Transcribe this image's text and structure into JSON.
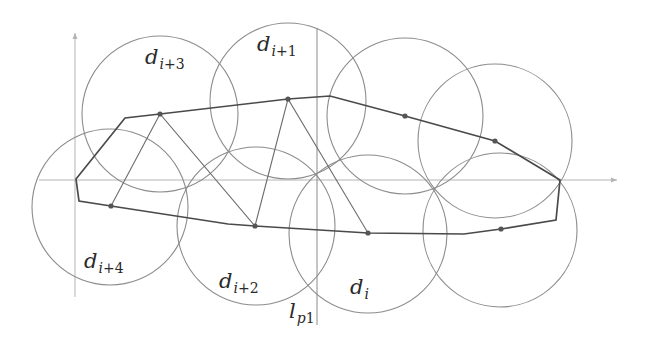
{
  "figure": {
    "colors": {
      "background": "#ffffff",
      "axis": "#b4b4b4",
      "disk_stroke": "#8c8c8c",
      "hull_stroke": "#4a4a4a",
      "zigzag_stroke": "#6e6e6e",
      "dot_fill": "#555555"
    },
    "axes": {
      "vertical": {
        "x": 75,
        "y1": 297,
        "y2": 33
      },
      "horizontal": {
        "y": 180,
        "x1": 39,
        "x2": 617
      }
    },
    "line_lp1": {
      "x": 317,
      "y1": 28,
      "y2": 325
    },
    "disks": [
      {
        "id": "d_i+3",
        "cx": 160,
        "cy": 114,
        "r": 78
      },
      {
        "id": "d_i+1",
        "cx": 288,
        "cy": 101,
        "r": 78
      },
      {
        "id": "disk-top-3",
        "cx": 405,
        "cy": 116,
        "r": 78
      },
      {
        "id": "disk-top-4",
        "cx": 495,
        "cy": 141,
        "r": 77
      },
      {
        "id": "d_i+4",
        "cx": 110,
        "cy": 207,
        "r": 78
      },
      {
        "id": "d_i+2",
        "cx": 256,
        "cy": 226,
        "r": 79
      },
      {
        "id": "d_i",
        "cx": 368,
        "cy": 234,
        "r": 79
      },
      {
        "id": "disk-bottom-right",
        "cx": 500,
        "cy": 230,
        "r": 77
      }
    ],
    "hull_points": [
      [
        76,
        179
      ],
      [
        125,
        118
      ],
      [
        160,
        114
      ],
      [
        288,
        99
      ],
      [
        330,
        96
      ],
      [
        405,
        116
      ],
      [
        495,
        141
      ],
      [
        560,
        180
      ],
      [
        556,
        220
      ],
      [
        501,
        229
      ],
      [
        464,
        234
      ],
      [
        368,
        233
      ],
      [
        255,
        226
      ],
      [
        228,
        224
      ],
      [
        111,
        206
      ],
      [
        79,
        201
      ]
    ],
    "zigzag_points": [
      [
        111,
        206
      ],
      [
        160,
        114
      ],
      [
        255,
        226
      ],
      [
        288,
        99
      ],
      [
        368,
        233
      ]
    ],
    "dots": [
      [
        160,
        114
      ],
      [
        288,
        99
      ],
      [
        405,
        116
      ],
      [
        495,
        141
      ],
      [
        111,
        206
      ],
      [
        255,
        226
      ],
      [
        368,
        233
      ],
      [
        501,
        229
      ]
    ],
    "labels": [
      {
        "name": "label-d-i-plus-3",
        "main": "d",
        "sub_var": "i",
        "sub_op": "+3",
        "x": 145,
        "y": 64
      },
      {
        "name": "label-d-i-plus-1",
        "main": "d",
        "sub_var": "i",
        "sub_op": "+1",
        "x": 257,
        "y": 51
      },
      {
        "name": "label-d-i-plus-4",
        "main": "d",
        "sub_var": "i",
        "sub_op": "+4",
        "x": 84,
        "y": 268
      },
      {
        "name": "label-d-i-plus-2",
        "main": "d",
        "sub_var": "i",
        "sub_op": "+2",
        "x": 219,
        "y": 288
      },
      {
        "name": "label-d-i",
        "main": "d",
        "sub_var": "i",
        "sub_op": "",
        "x": 350,
        "y": 294
      },
      {
        "name": "label-l-p1",
        "main": "l",
        "sub_var": "p",
        "sub_op": "1",
        "x": 289,
        "y": 318
      }
    ]
  }
}
